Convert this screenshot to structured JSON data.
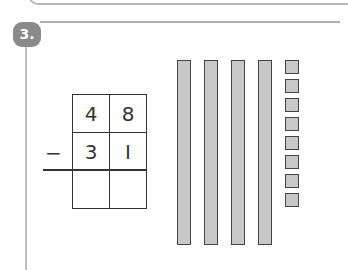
{
  "exercise": {
    "number": "3.",
    "subtraction": {
      "operator": "−",
      "rows": [
        [
          "4",
          "8"
        ],
        [
          "3",
          "I"
        ],
        [
          "",
          ""
        ]
      ]
    },
    "base_ten_blocks": {
      "tens_rods": 4,
      "unit_cubes": 8
    }
  }
}
